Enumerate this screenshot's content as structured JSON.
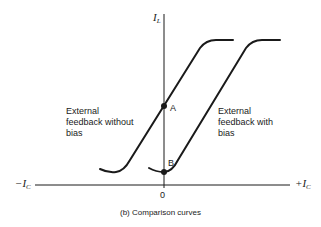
{
  "figure": {
    "caption_prefix": "(b)",
    "caption_text": "Comparison curves"
  },
  "axes": {
    "y_label_main": "I",
    "y_label_sub": "L",
    "x_neg_main": "−I",
    "x_neg_sub": "C",
    "x_pos_main": "+I",
    "x_pos_sub": "C",
    "origin_label": "0"
  },
  "points": {
    "a_label": "A",
    "b_label": "B"
  },
  "curves": {
    "left_label_line1": "External",
    "left_label_line2": "feedback without",
    "left_label_line3": "bias",
    "right_label_line1": "External",
    "right_label_line2": "feedback with",
    "right_label_line3": "bias"
  },
  "colors": {
    "ink": "#1a1a1a",
    "background": "#ffffff"
  }
}
